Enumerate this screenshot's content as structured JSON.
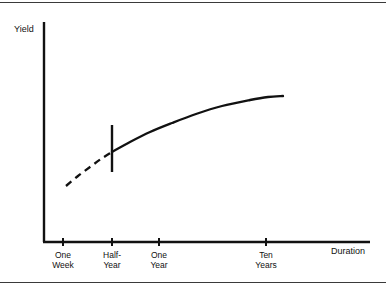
{
  "figure": {
    "ylabel": "Yield",
    "xlabel": "Duration"
  },
  "chart_data": {
    "type": "line",
    "title": "",
    "subtitle": "",
    "xlabel": "Duration",
    "ylabel": "Yield",
    "grid": false,
    "legend": null,
    "axis_style": "schematic",
    "x_tick_labels": [
      "One\nWeek",
      "Half-\nYear",
      "One\nYear",
      "Ten\nYears"
    ],
    "x_tick_positions_px": [
      63,
      112,
      159,
      266
    ],
    "y_tick_labels": [],
    "xlim_px": [
      44,
      370
    ],
    "ylim_px": [
      242,
      22
    ],
    "series": [
      {
        "name": "yield-curve-dashed-segment",
        "style": "dashed",
        "points_px": [
          [
            66,
            186
          ],
          [
            78,
            176
          ],
          [
            90,
            167
          ],
          [
            101,
            159
          ],
          [
            112,
            152
          ]
        ]
      },
      {
        "name": "yield-curve-solid-segment",
        "style": "solid",
        "points_px": [
          [
            112,
            152
          ],
          [
            130,
            142
          ],
          [
            150,
            132
          ],
          [
            172,
            123
          ],
          [
            196,
            114
          ],
          [
            222,
            106
          ],
          [
            250,
            100
          ],
          [
            268,
            97
          ],
          [
            283,
            96
          ]
        ]
      }
    ],
    "annotations": [
      {
        "name": "half-year-vertical-marker",
        "type": "vertical-line",
        "x_px": 112,
        "y_top_px": 125,
        "y_bottom_px": 172
      }
    ]
  }
}
